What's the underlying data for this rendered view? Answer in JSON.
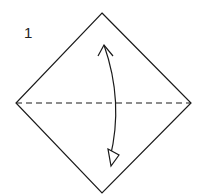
{
  "diagram": {
    "step_number": "1",
    "square": {
      "top": [
        102,
        13
      ],
      "right": [
        191,
        103
      ],
      "bottom": [
        102,
        193
      ],
      "left": [
        16,
        103
      ],
      "stroke": "#1a1a1a"
    },
    "fold_line": {
      "type": "valley-dashed",
      "from": [
        16,
        103
      ],
      "to": [
        191,
        103
      ]
    },
    "arrow": {
      "type": "fold-and-unfold",
      "from": [
        104,
        45
      ],
      "to": [
        110,
        160
      ],
      "bow": "right"
    }
  }
}
